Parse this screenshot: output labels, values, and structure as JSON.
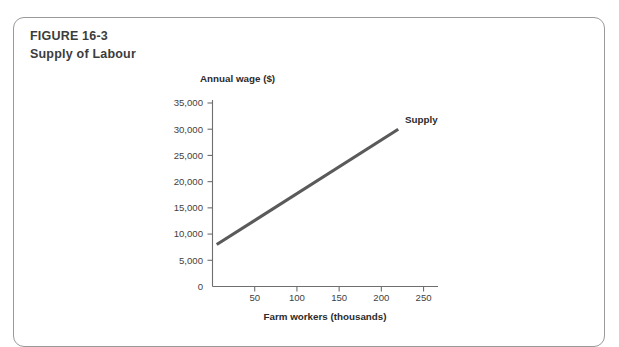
{
  "figure": {
    "number": "FIGURE 16-3",
    "caption": "Supply of Labour"
  },
  "chart_data": {
    "type": "line",
    "title": "",
    "xlabel": "Farm workers (thousands)",
    "ylabel": "Annual wage ($)",
    "xlim": [
      0,
      260
    ],
    "ylim": [
      0,
      35000
    ],
    "grid": false,
    "legend": "inline-label-at-line-end",
    "xticks": [
      0,
      50,
      100,
      150,
      200,
      250
    ],
    "xtick_labels": [
      "0",
      "50",
      "100",
      "150",
      "200",
      "250"
    ],
    "yticks": [
      0,
      5000,
      10000,
      15000,
      20000,
      25000,
      30000,
      35000
    ],
    "ytick_labels": [
      "0",
      "5,000",
      "10,000",
      "15,000",
      "20,000",
      "25,000",
      "30,000",
      "35,000"
    ],
    "series": [
      {
        "name": "Supply",
        "color": "#5a5a5a",
        "x": [
          5,
          220
        ],
        "y": [
          8000,
          30000
        ]
      }
    ],
    "annotations": [
      {
        "text": "Supply",
        "x": 228,
        "y": 31200
      }
    ]
  }
}
